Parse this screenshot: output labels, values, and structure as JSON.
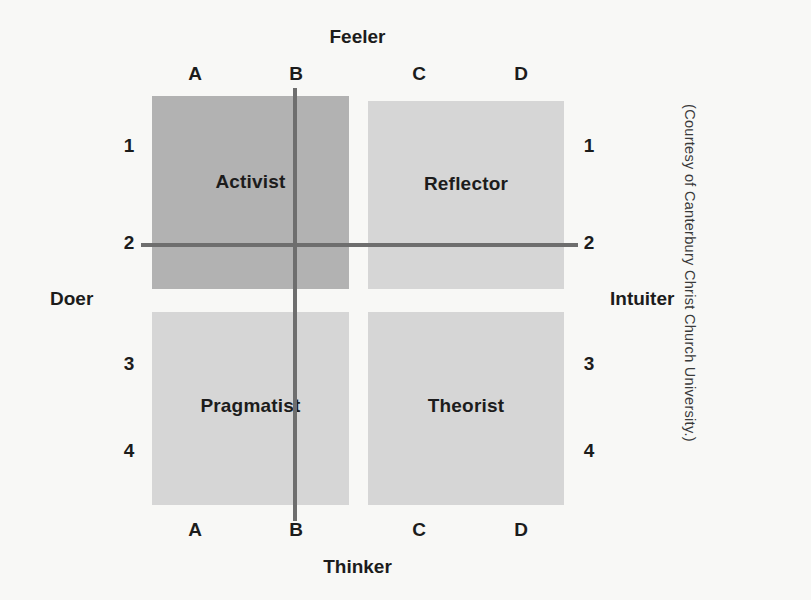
{
  "figure": {
    "credit": "(Courtesy of Canterbury Christ Church University.)"
  },
  "poles": {
    "top": "Feeler",
    "bottom": "Thinker",
    "left": "Doer",
    "right": "Intuiter"
  },
  "axes": {
    "columns": [
      "A",
      "B",
      "C",
      "D"
    ],
    "rows": [
      "1",
      "2",
      "3",
      "4"
    ]
  },
  "ticks": {
    "top": {
      "a": "A",
      "b": "B",
      "c": "C",
      "d": "D"
    },
    "bottom": {
      "a": "A",
      "b": "B",
      "c": "C",
      "d": "D"
    },
    "left": {
      "r1": "1",
      "r2": "2",
      "r3": "3",
      "r4": "4"
    },
    "right": {
      "r1": "1",
      "r2": "2",
      "r3": "3",
      "r4": "4"
    }
  },
  "quadrants": [
    {
      "key": "activist",
      "label": "Activist",
      "column_span": "A-B",
      "row_span": "1-2",
      "fill": "#b2b2b2",
      "position": "top-left"
    },
    {
      "key": "reflector",
      "label": "Reflector",
      "column_span": "C-D",
      "row_span": "1-2",
      "fill": "#d6d6d6",
      "position": "top-right"
    },
    {
      "key": "pragmatist",
      "label": "Pragmatist",
      "column_span": "A-B",
      "row_span": "3-4",
      "fill": "#d6d6d6",
      "position": "bottom-left"
    },
    {
      "key": "theorist",
      "label": "Theorist",
      "column_span": "C-D",
      "row_span": "3-4",
      "fill": "#d6d6d6",
      "position": "bottom-right"
    }
  ],
  "colors": {
    "background": "#f8f8f6",
    "axis_line": "#6e6e6e",
    "highlight_fill": "#b2b2b2",
    "normal_fill": "#d6d6d6",
    "text": "#1c1c1c"
  },
  "chart_data": {
    "type": "scatter",
    "xlabel": "Thinker – Feeler",
    "ylabel": "Doer – Intuiter",
    "x_axis_poles": {
      "low": "Doer",
      "high": "Intuiter"
    },
    "y_axis_poles": {
      "low": "Thinker",
      "high": "Feeler"
    },
    "x_tick_labels": [
      "A",
      "B",
      "C",
      "D"
    ],
    "y_tick_labels": [
      "1",
      "2",
      "3",
      "4"
    ],
    "grid": false,
    "legend": "none",
    "quadrant_cells": [
      {
        "name": "Activist",
        "x_range": [
          "A",
          "B"
        ],
        "y_range": [
          "1",
          "2"
        ],
        "shade": "dark"
      },
      {
        "name": "Reflector",
        "x_range": [
          "C",
          "D"
        ],
        "y_range": [
          "1",
          "2"
        ],
        "shade": "light"
      },
      {
        "name": "Pragmatist",
        "x_range": [
          "A",
          "B"
        ],
        "y_range": [
          "3",
          "4"
        ],
        "shade": "light"
      },
      {
        "name": "Theorist",
        "x_range": [
          "C",
          "D"
        ],
        "y_range": [
          "3",
          "4"
        ],
        "shade": "light"
      }
    ],
    "crosshair": {
      "x_at": "B",
      "y_at": "2"
    },
    "annotations": [
      "(Courtesy of Canterbury Christ Church University.)"
    ]
  }
}
